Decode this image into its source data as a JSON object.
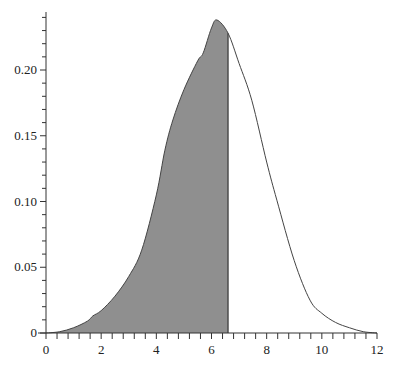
{
  "chart_data": {
    "type": "area",
    "title": "",
    "xlabel": "",
    "ylabel": "",
    "xlim": [
      0,
      12
    ],
    "ylim": [
      0,
      0.244
    ],
    "grid": false,
    "x_ticks": [
      "0",
      "2",
      "4",
      "6",
      "8",
      "10",
      "12"
    ],
    "x_tick_values": [
      0,
      2,
      4,
      6,
      8,
      10,
      12
    ],
    "x_minor_step": 0.4,
    "y_ticks": [
      "0",
      "0.05",
      "0.10",
      "0.15",
      "0.20"
    ],
    "y_tick_values": [
      0,
      0.05,
      0.1,
      0.15,
      0.2
    ],
    "y_minor_step": 0.01,
    "shaded_region": {
      "from": 0,
      "to": 6.6,
      "color": "#8f8f8f"
    },
    "series": [
      {
        "name": "density",
        "color": "#444444",
        "x": [
          0,
          0.5,
          1,
          1.5,
          1.7,
          2,
          2.5,
          3,
          3.47,
          4,
          4.31,
          4.6,
          5,
          5.5,
          5.7,
          6,
          6.2,
          6.6,
          7,
          7.46,
          8,
          8.37,
          9,
          9.57,
          10,
          10.5,
          11,
          11.5,
          12
        ],
        "values": [
          0,
          0.001,
          0.004,
          0.009,
          0.013,
          0.017,
          0.028,
          0.043,
          0.063,
          0.105,
          0.139,
          0.162,
          0.185,
          0.207,
          0.213,
          0.232,
          0.238,
          0.228,
          0.205,
          0.177,
          0.13,
          0.101,
          0.055,
          0.025,
          0.015,
          0.008,
          0.004,
          0.001,
          0
        ]
      }
    ]
  }
}
